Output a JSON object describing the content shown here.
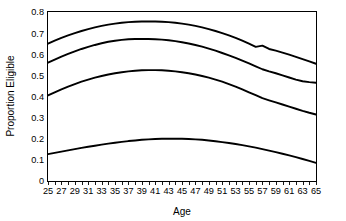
{
  "chart_data": {
    "type": "line",
    "title": "",
    "xlabel": "Age",
    "ylabel": "Proportion Eligible",
    "xlim": [
      25,
      65
    ],
    "ylim": [
      0,
      0.8
    ],
    "grid": false,
    "legend": "none",
    "x_tick_labels": [
      "25",
      "27",
      "29",
      "31",
      "33",
      "35",
      "37",
      "39",
      "41",
      "43",
      "45",
      "47",
      "49",
      "51",
      "53",
      "55",
      "57",
      "59",
      "61",
      "63",
      "65"
    ],
    "x_tick_values": [
      25,
      27,
      29,
      31,
      33,
      35,
      37,
      39,
      41,
      43,
      45,
      47,
      49,
      51,
      53,
      55,
      57,
      59,
      61,
      63,
      65
    ],
    "x_minor_tick_values": [
      25,
      26,
      27,
      28,
      29,
      30,
      31,
      32,
      33,
      34,
      35,
      36,
      37,
      38,
      39,
      40,
      41,
      42,
      43,
      44,
      45,
      46,
      47,
      48,
      49,
      50,
      51,
      52,
      53,
      54,
      55,
      56,
      57,
      58,
      59,
      60,
      61,
      62,
      63,
      64,
      65
    ],
    "y_tick_labels": [
      "0",
      "0.1",
      "0.2",
      "0.3",
      "0.4",
      "0.5",
      "0.6",
      "0.7",
      "0.8"
    ],
    "y_tick_values": [
      0,
      0.1,
      0.2,
      0.3,
      0.4,
      0.5,
      0.6,
      0.7,
      0.8
    ],
    "x": [
      25,
      26,
      27,
      28,
      29,
      30,
      31,
      32,
      33,
      34,
      35,
      36,
      37,
      38,
      39,
      40,
      41,
      42,
      43,
      44,
      45,
      46,
      47,
      48,
      49,
      50,
      51,
      52,
      53,
      54,
      55,
      56,
      57,
      58,
      59,
      60,
      61,
      62,
      63,
      64,
      65
    ],
    "series": [
      {
        "name": "curve-1",
        "color": "#000000",
        "values": [
          0.65,
          0.664,
          0.677,
          0.689,
          0.7,
          0.71,
          0.719,
          0.727,
          0.734,
          0.74,
          0.745,
          0.749,
          0.752,
          0.754,
          0.755,
          0.755,
          0.755,
          0.754,
          0.752,
          0.749,
          0.745,
          0.74,
          0.734,
          0.727,
          0.719,
          0.71,
          0.7,
          0.689,
          0.677,
          0.664,
          0.65,
          0.635,
          0.641,
          0.625,
          0.617,
          0.608,
          0.598,
          0.588,
          0.577,
          0.566,
          0.555
        ]
      },
      {
        "name": "curve-2",
        "color": "#000000",
        "values": [
          0.56,
          0.575,
          0.589,
          0.602,
          0.614,
          0.625,
          0.635,
          0.644,
          0.652,
          0.659,
          0.664,
          0.668,
          0.671,
          0.672,
          0.672,
          0.672,
          0.671,
          0.669,
          0.666,
          0.662,
          0.657,
          0.651,
          0.644,
          0.636,
          0.627,
          0.617,
          0.606,
          0.595,
          0.583,
          0.57,
          0.557,
          0.543,
          0.529,
          0.519,
          0.51,
          0.5,
          0.49,
          0.48,
          0.472,
          0.468,
          0.465
        ]
      },
      {
        "name": "curve-3",
        "color": "#000000",
        "values": [
          0.405,
          0.42,
          0.434,
          0.447,
          0.459,
          0.47,
          0.48,
          0.489,
          0.497,
          0.504,
          0.51,
          0.515,
          0.519,
          0.522,
          0.524,
          0.525,
          0.525,
          0.524,
          0.522,
          0.519,
          0.515,
          0.51,
          0.504,
          0.497,
          0.489,
          0.48,
          0.47,
          0.459,
          0.447,
          0.434,
          0.42,
          0.406,
          0.392,
          0.382,
          0.372,
          0.362,
          0.352,
          0.342,
          0.332,
          0.323,
          0.315
        ]
      },
      {
        "name": "curve-4",
        "color": "#000000",
        "values": [
          0.127,
          0.133,
          0.139,
          0.145,
          0.151,
          0.157,
          0.162,
          0.167,
          0.172,
          0.177,
          0.181,
          0.185,
          0.189,
          0.192,
          0.195,
          0.197,
          0.199,
          0.2,
          0.2,
          0.2,
          0.2,
          0.199,
          0.197,
          0.195,
          0.192,
          0.188,
          0.184,
          0.18,
          0.175,
          0.17,
          0.164,
          0.158,
          0.151,
          0.144,
          0.137,
          0.129,
          0.121,
          0.113,
          0.104,
          0.095,
          0.086
        ]
      }
    ]
  }
}
